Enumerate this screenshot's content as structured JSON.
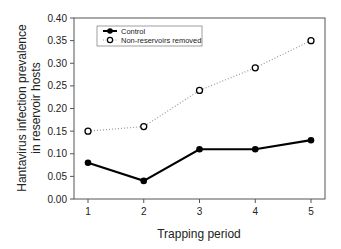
{
  "chart_data": {
    "type": "line",
    "title": "",
    "xlabel": "Trapping period",
    "ylabel_lines": [
      "Hantavirus infection prevalence",
      "in reservoir hosts"
    ],
    "x": [
      1,
      2,
      3,
      4,
      5
    ],
    "ylim": [
      0.0,
      0.4
    ],
    "yticks": [
      "0.00",
      "0.05",
      "0.10",
      "0.15",
      "0.20",
      "0.25",
      "0.30",
      "0.35",
      "0.40"
    ],
    "xticks": [
      "1",
      "2",
      "3",
      "4",
      "5"
    ],
    "grid": false,
    "legend_position": "upper-left",
    "series": [
      {
        "name": "Control",
        "values": [
          0.08,
          0.04,
          0.11,
          0.11,
          0.13
        ],
        "line": "solid",
        "marker": "filled-circle",
        "color": "#000000"
      },
      {
        "name": "Non-reservoirs removed",
        "values": [
          0.15,
          0.16,
          0.24,
          0.29,
          0.35
        ],
        "line": "dotted",
        "marker": "open-circle",
        "color": "#999999"
      }
    ]
  }
}
